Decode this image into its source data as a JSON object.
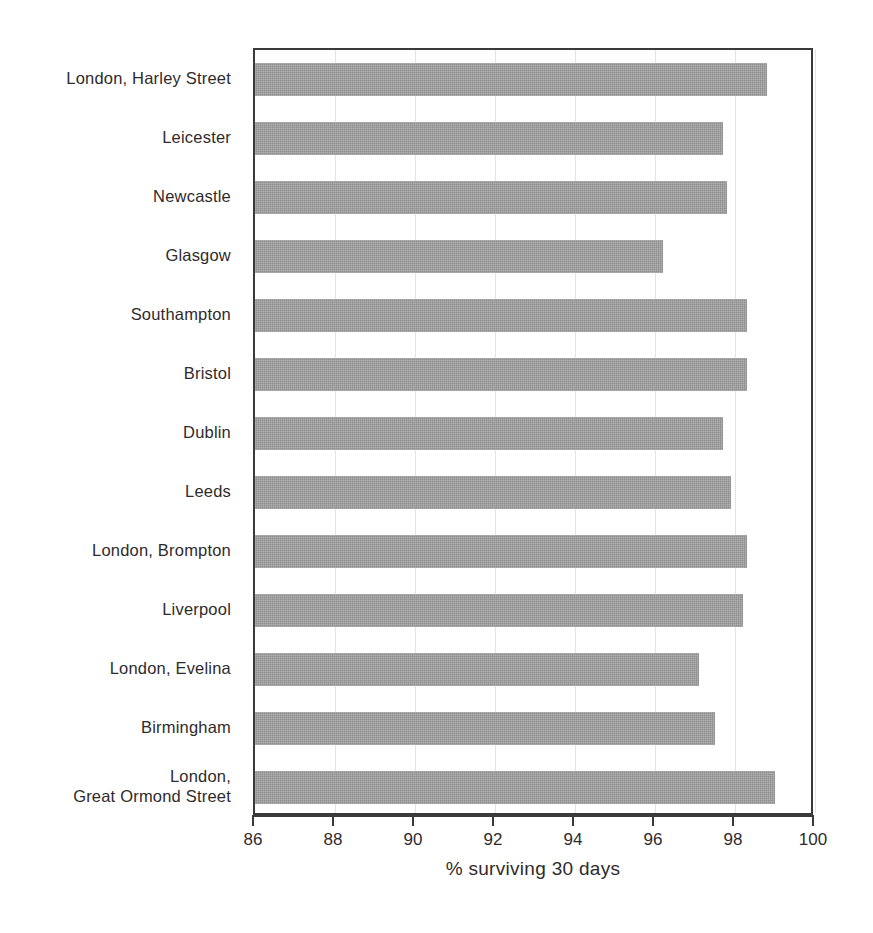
{
  "chart_data": {
    "type": "bar",
    "orientation": "horizontal",
    "title": "",
    "xlabel": "% surviving 30 days",
    "ylabel": "",
    "xlim": [
      86,
      100
    ],
    "xticks": [
      86,
      88,
      90,
      92,
      94,
      96,
      98,
      100
    ],
    "xtick_labels": [
      "86",
      "88",
      "90",
      "92",
      "94",
      "96",
      "98",
      "100"
    ],
    "grid": "vertical gridlines at each x tick",
    "legend": "none",
    "bar_color": "#8e8e8e",
    "axis_color": "#3a3a3a",
    "categories": [
      "London, Harley Street",
      "Leicester",
      "Newcastle",
      "Glasgow",
      "Southampton",
      "Bristol",
      "Dublin",
      "Leeds",
      "London, Brompton",
      "Liverpool",
      "London, Evelina",
      "Birmingham",
      "London, Great Ormond Street"
    ],
    "category_lines": [
      [
        "London, Harley Street"
      ],
      [
        "Leicester"
      ],
      [
        "Newcastle"
      ],
      [
        "Glasgow"
      ],
      [
        "Southampton"
      ],
      [
        "Bristol"
      ],
      [
        "Dublin"
      ],
      [
        "Leeds"
      ],
      [
        "London, Brompton"
      ],
      [
        "Liverpool"
      ],
      [
        "London, Evelina"
      ],
      [
        "Birmingham"
      ],
      [
        "London,",
        "Great Ormond Street"
      ]
    ],
    "values": [
      98.8,
      97.7,
      97.8,
      96.2,
      98.3,
      98.3,
      97.7,
      97.9,
      98.3,
      98.2,
      97.1,
      97.5,
      99.0
    ]
  }
}
